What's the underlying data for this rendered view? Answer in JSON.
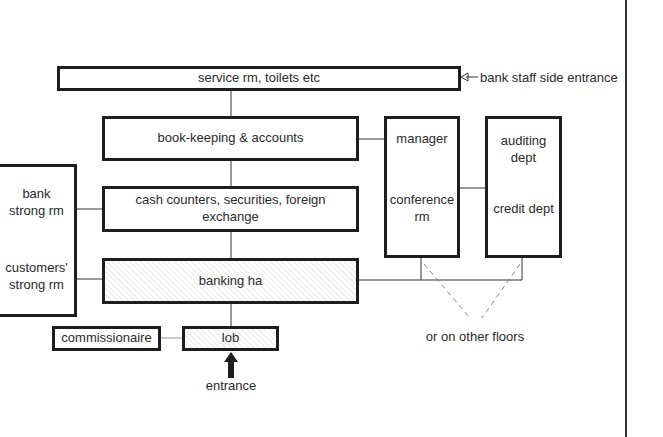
{
  "diagram": {
    "type": "floor-plan-relationship",
    "boxes": {
      "service": "service rm, toilets etc",
      "bookkeeping": "book-keeping & accounts",
      "cash": "cash counters, securities, foreign exchange",
      "banking_hall": "banking ha",
      "lobby": "lob",
      "commissionaire": "commissionaire",
      "bank_strong": "bank strong rm",
      "customers_strong": "customers' strong rm",
      "manager": "manager",
      "conference": "conference rm",
      "auditing": "auditing dept",
      "credit": "credit dept"
    },
    "annotations": {
      "staff_entrance": "bank staff side entrance",
      "entrance": "entrance",
      "other_floors": "or on other floors"
    },
    "colors": {
      "line": "#1e1e1e",
      "background": "#ffffff",
      "text": "#2a2a2a"
    }
  }
}
